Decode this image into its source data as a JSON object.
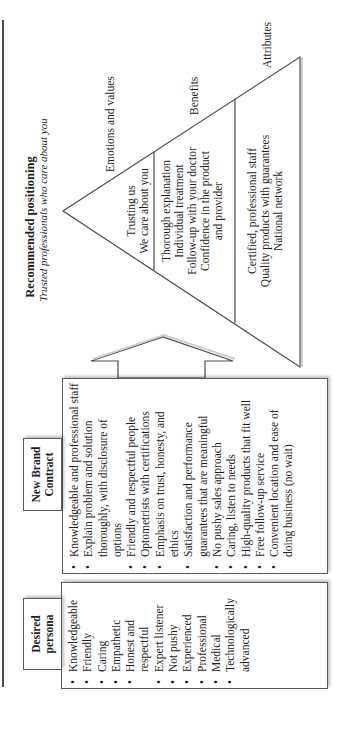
{
  "positioning": {
    "title": "Recommended positioning",
    "subtitle": "Trusted professionals who care about you",
    "tiers": [
      {
        "label": "Emotions and values",
        "lines": [
          "Trusting us",
          "We care about you"
        ]
      },
      {
        "label": "Benefits",
        "lines": [
          "Thorough explanation",
          "Individual treatment",
          "Follow-up with your doctor",
          "Confidence in the product",
          "and provider"
        ]
      },
      {
        "label": "Attributes",
        "lines": [
          "Certified, professional staff",
          "Quality products with guarantees",
          "National network"
        ]
      }
    ]
  },
  "new_brand_contract": {
    "header": [
      "New Brand",
      "Contract"
    ],
    "items": [
      "Knowledgeable and professional staff",
      "Explain problem and solution thoroughly, with disclosure of options",
      "Friendly and respectful people",
      "Optometrists with certifications",
      "Emphasis on trust, honesty, and ethics",
      "Satisfaction and performance guarantees that are meaningful",
      "No pushy sales approach",
      "Caring, listen to needs",
      "High-quality products that fit well",
      "Free follow-up service",
      "Convenient location and ease of doing business (no wait)"
    ]
  },
  "desired_persona": {
    "header": [
      "Desired",
      "persona"
    ],
    "items": [
      "Knowledgeable",
      "Friendly",
      "Caring",
      "Empathetic",
      "Honest and respectful",
      "Expert listener",
      "Not pushy",
      "Experienced",
      "Professional",
      "Medical",
      "Technologically advanced"
    ]
  },
  "colors": {
    "line": "#4a4a4a",
    "text": "#1e1e1e",
    "background": "#ffffff"
  }
}
